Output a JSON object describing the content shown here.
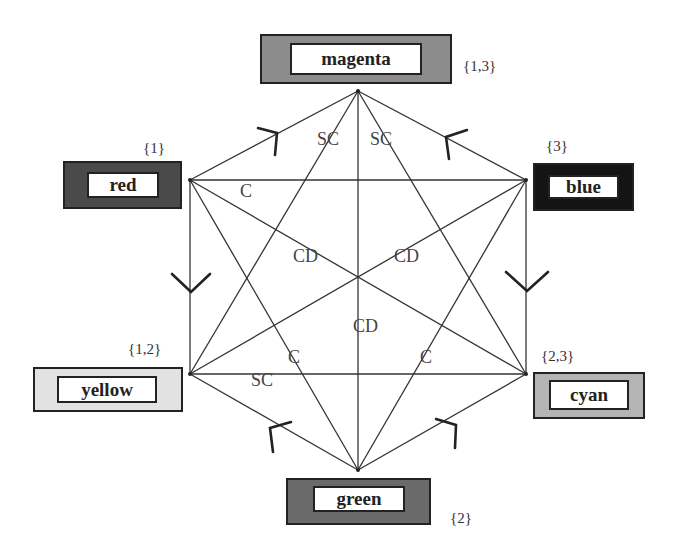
{
  "diagram": {
    "type": "color hexagon graph",
    "nodes": [
      {
        "id": "magenta",
        "label": "magenta",
        "set": "{1,3}",
        "fill": "#8c8c8c"
      },
      {
        "id": "red",
        "label": "red",
        "set": "{1}",
        "fill": "#4a4a4a"
      },
      {
        "id": "blue",
        "label": "blue",
        "set": "{3}",
        "fill": "#141414"
      },
      {
        "id": "yellow",
        "label": "yellow",
        "set": "{1,2}",
        "fill": "#e2e2e2"
      },
      {
        "id": "cyan",
        "label": "cyan",
        "set": "{2,3}",
        "fill": "#b4b4b4"
      },
      {
        "id": "green",
        "label": "green",
        "set": "{2}",
        "fill": "#6a6a6a"
      }
    ],
    "edge_labels": [
      {
        "id": "sc-magenta-yellow",
        "text": "SC"
      },
      {
        "id": "sc-magenta-cyan",
        "text": "SC"
      },
      {
        "id": "c-red-blue",
        "text": "C"
      },
      {
        "id": "cd-red-cyan",
        "text": "CD"
      },
      {
        "id": "cd-blue-yellow",
        "text": "CD"
      },
      {
        "id": "cd-magenta-green",
        "text": "CD"
      },
      {
        "id": "c-red-green",
        "text": "C"
      },
      {
        "id": "c-blue-green",
        "text": "C"
      },
      {
        "id": "sc-yellow-cyan",
        "text": "SC"
      }
    ],
    "arrows": [
      {
        "from": "red",
        "to": "magenta"
      },
      {
        "from": "blue",
        "to": "magenta"
      },
      {
        "from": "red",
        "to": "yellow"
      },
      {
        "from": "blue",
        "to": "cyan"
      },
      {
        "from": "green",
        "to": "yellow"
      },
      {
        "from": "green",
        "to": "cyan"
      }
    ]
  }
}
